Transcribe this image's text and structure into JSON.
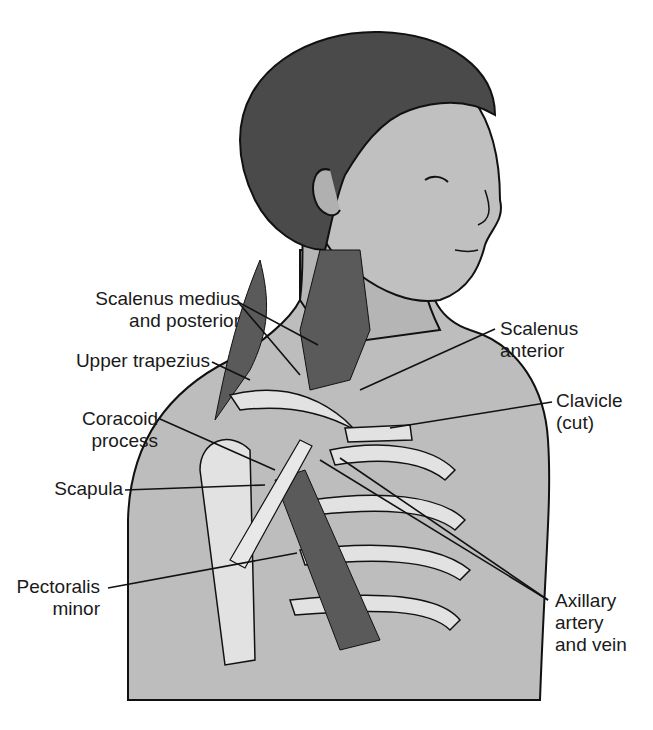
{
  "figure": {
    "colors": {
      "background": "#ffffff",
      "skin": "#b9b9b9",
      "skin_dark": "#9a9a9a",
      "hair": "#4a4a4a",
      "muscle": "#5a5a5a",
      "bone": "#e2e2e2",
      "outline": "#111111"
    }
  },
  "labels": {
    "scalenus_medius": {
      "line1": "Scalenus medius",
      "line2": "and posterior"
    },
    "upper_trapezius": {
      "line1": "Upper trapezius"
    },
    "coracoid": {
      "line1": "Coracoid",
      "line2": "process"
    },
    "scapula": {
      "line1": "Scapula"
    },
    "pectoralis": {
      "line1": "Pectoralis",
      "line2": "minor"
    },
    "scalenus_anterior": {
      "line1": "Scalenus",
      "line2": "anterior"
    },
    "clavicle": {
      "line1": "Clavicle",
      "line2": "(cut)"
    },
    "axillary": {
      "line1": "Axillary",
      "line2": "artery",
      "line3": "and vein"
    }
  }
}
